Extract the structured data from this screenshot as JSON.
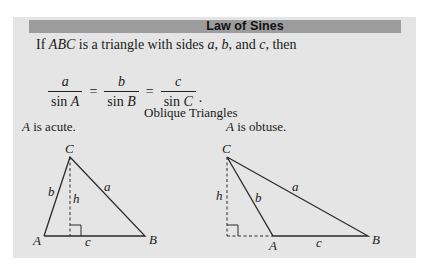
{
  "header": {
    "title": "Law of Sines"
  },
  "intro": {
    "prefix": "If ",
    "triangle": "ABC",
    "middle": " is a triangle with sides ",
    "side_a": "a",
    "sep1": ", ",
    "side_b": "b",
    "sep2": ", and ",
    "side_c": "c",
    "suffix": ", then"
  },
  "formula": {
    "fractions": [
      {
        "numerator": "a",
        "denominator_fn": "sin ",
        "denominator_var": "A"
      },
      {
        "numerator": "b",
        "denominator_fn": "sin ",
        "denominator_var": "B"
      },
      {
        "numerator": "c",
        "denominator_fn": "sin ",
        "denominator_var": "C"
      }
    ],
    "equals": "=",
    "end": "."
  },
  "figure": {
    "subtitle": "Oblique Triangles",
    "cases": [
      {
        "angle": "A",
        "text": " is acute.",
        "labels": {
          "A": "A",
          "B": "B",
          "C": "C",
          "a": "a",
          "b": "b",
          "c": "c",
          "h": "h"
        }
      },
      {
        "angle": "A",
        "text": " is obtuse.",
        "labels": {
          "A": "A",
          "B": "B",
          "C": "C",
          "a": "a",
          "b": "b",
          "c": "c",
          "h": "h"
        }
      }
    ]
  },
  "colors": {
    "box_background": "#e5e5e5",
    "header_background": "#9c9c9c",
    "line": "#2a2a2a"
  }
}
